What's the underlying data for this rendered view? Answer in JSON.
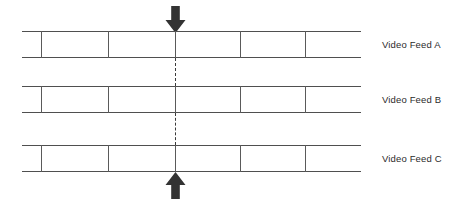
{
  "diagram": {
    "background_color": "#ffffff",
    "line_color": "#4f4f4f",
    "arrow_color": "#333333",
    "dash_color": "#3a3a3a",
    "label_color": "#2b2b2b",
    "feeds": [
      {
        "label": "Video Feed A",
        "band_top_y": 31,
        "band_bottom_y": 58,
        "band_left_x": 22,
        "band_right_x": 361,
        "tick_positions": [
          41,
          108,
          175,
          240,
          305
        ],
        "label_x": 382,
        "label_y": 40
      },
      {
        "label": "Video Feed B",
        "band_top_y": 86,
        "band_bottom_y": 113,
        "band_left_x": 22,
        "band_right_x": 361,
        "tick_positions": [
          41,
          108,
          175,
          240,
          305
        ],
        "label_x": 382,
        "label_y": 95
      },
      {
        "label": "Video Feed C",
        "band_top_y": 145,
        "band_bottom_y": 172,
        "band_left_x": 22,
        "band_right_x": 361,
        "tick_positions": [
          41,
          108,
          175,
          240,
          305
        ],
        "label_x": 382,
        "label_y": 154
      }
    ],
    "sync_line": {
      "x": 175,
      "segments": [
        {
          "from_y": 58,
          "to_y": 86,
          "style": "dashed"
        },
        {
          "from_y": 113,
          "to_y": 145,
          "style": "dashed"
        }
      ]
    },
    "arrows": [
      {
        "name": "sync-arrow-down",
        "direction": "down",
        "x": 175,
        "top_y": 7,
        "bottom_y": 32,
        "shaft_width": 9,
        "head_width": 19
      },
      {
        "name": "sync-arrow-up",
        "direction": "up",
        "x": 175,
        "top_y": 172,
        "bottom_y": 197,
        "shaft_width": 9,
        "head_width": 19
      }
    ]
  }
}
